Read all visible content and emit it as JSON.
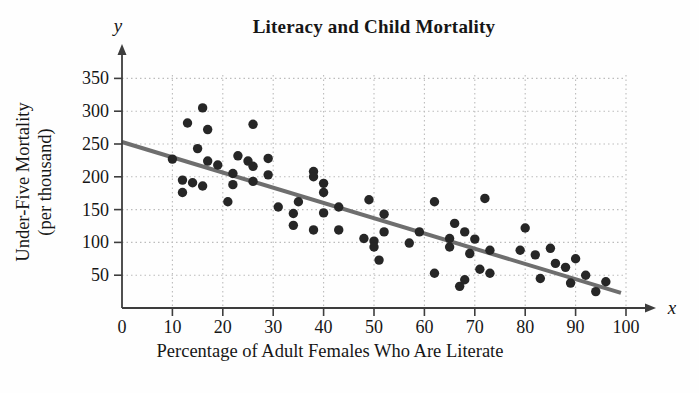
{
  "chart_data": {
    "type": "scatter",
    "title": "Literacy and Child Mortality",
    "xlabel": "Percentage of Adult Females Who Are Literate",
    "ylabel": "Under-Five Mortality (per thousand)",
    "ylabel_line1": "Under-Five Mortality",
    "ylabel_line2": "(per thousand)",
    "x_axis_symbol": "x",
    "y_axis_symbol": "y",
    "xlim": [
      0,
      105
    ],
    "ylim": [
      0,
      370
    ],
    "x_ticks": [
      0,
      10,
      20,
      30,
      40,
      50,
      60,
      70,
      80,
      90,
      100
    ],
    "y_ticks": [
      50,
      100,
      150,
      200,
      250,
      300,
      350
    ],
    "grid": "dotted",
    "legend": "none",
    "points": [
      [
        10,
        227
      ],
      [
        12,
        195
      ],
      [
        12,
        176
      ],
      [
        13,
        282
      ],
      [
        14,
        191
      ],
      [
        15,
        243
      ],
      [
        16,
        305
      ],
      [
        16,
        186
      ],
      [
        17,
        272
      ],
      [
        17,
        224
      ],
      [
        19,
        218
      ],
      [
        21,
        162
      ],
      [
        22,
        205
      ],
      [
        22,
        188
      ],
      [
        23,
        232
      ],
      [
        25,
        224
      ],
      [
        26,
        280
      ],
      [
        26,
        216
      ],
      [
        26,
        193
      ],
      [
        29,
        228
      ],
      [
        29,
        203
      ],
      [
        31,
        154
      ],
      [
        34,
        144
      ],
      [
        34,
        126
      ],
      [
        35,
        162
      ],
      [
        38,
        208
      ],
      [
        38,
        200
      ],
      [
        38,
        119
      ],
      [
        40,
        190
      ],
      [
        40,
        176
      ],
      [
        40,
        145
      ],
      [
        43,
        154
      ],
      [
        43,
        119
      ],
      [
        48,
        106
      ],
      [
        49,
        165
      ],
      [
        50,
        102
      ],
      [
        50,
        93
      ],
      [
        51,
        73
      ],
      [
        52,
        143
      ],
      [
        52,
        116
      ],
      [
        57,
        99
      ],
      [
        59,
        116
      ],
      [
        62,
        162
      ],
      [
        62,
        53
      ],
      [
        65,
        106
      ],
      [
        65,
        93
      ],
      [
        66,
        129
      ],
      [
        67,
        33
      ],
      [
        68,
        116
      ],
      [
        68,
        43
      ],
      [
        69,
        83
      ],
      [
        70,
        105
      ],
      [
        71,
        59
      ],
      [
        72,
        167
      ],
      [
        73,
        88
      ],
      [
        73,
        53
      ],
      [
        79,
        88
      ],
      [
        80,
        122
      ],
      [
        82,
        81
      ],
      [
        83,
        45
      ],
      [
        85,
        91
      ],
      [
        86,
        68
      ],
      [
        88,
        62
      ],
      [
        89,
        38
      ],
      [
        90,
        75
      ],
      [
        92,
        50
      ],
      [
        94,
        25
      ],
      [
        96,
        40
      ]
    ],
    "trend_line": {
      "x1": 0,
      "y1": 253,
      "x2": 99,
      "y2": 23
    },
    "colors": {
      "point": "#262626",
      "trend": "#6e6e6e",
      "axis": "#3d3d3d",
      "grid": "#bcbcbc",
      "text": "#161616"
    }
  }
}
